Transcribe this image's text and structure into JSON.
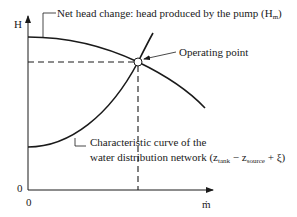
{
  "axes": {
    "y_label": "H",
    "x_label": "ṁ",
    "y_origin": "0",
    "x_origin": "0"
  },
  "labels": {
    "pump_curve": {
      "prefix": "Net head change: head produced by the pump (H",
      "sub": "m",
      "suffix": ")"
    },
    "operating_point": "Operating point",
    "system_curve": {
      "line1": "Characteristic curve of the",
      "line2_prefix": "water distribution network (z",
      "sub1": "tank",
      "mid": " − z",
      "sub2": "source",
      "suffix": " + ξ)"
    }
  },
  "colors": {
    "line": "#1a1a1a",
    "background": "#ffffff"
  }
}
